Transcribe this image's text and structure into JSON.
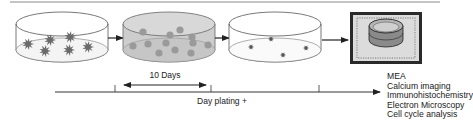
{
  "diagram": {
    "stages": [
      {
        "id": "dish-1",
        "content": "cell clusters (star shaped)"
      },
      {
        "id": "dish-2",
        "content": "dissociated spheres (shaded medium)"
      },
      {
        "id": "dish-3",
        "content": "sparse plated cells"
      },
      {
        "id": "mea-chip",
        "content": "MEA chip with culture ring"
      }
    ],
    "duration_label": "10 Days",
    "timeline_label": "Day plating +",
    "methods": [
      "MEA",
      "Calcium imaging",
      "Immunohistochemistry",
      "Electron Microscopy",
      "Cell cycle analysis"
    ],
    "colors": {
      "line": "#333333",
      "dish_stroke": "#555555",
      "dish2_fill": "#c9c9c9",
      "sphere": "#9a9a9a",
      "cluster": "#6a6a6a",
      "chip": "#2a2a2a",
      "chip_inner": "#d8d8d8",
      "top_rule": "#8a8a8a"
    }
  }
}
